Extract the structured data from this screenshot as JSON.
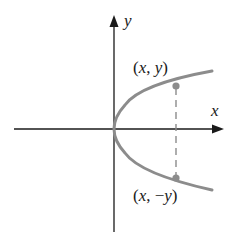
{
  "diagram": {
    "axes": {
      "x_label": "x",
      "y_label": "y"
    },
    "curve": {
      "equation_hint": "x = y^2",
      "color": "#8c8c8c"
    },
    "points": [
      {
        "label": "(x, y)",
        "x_part": "x",
        "y_part": "y",
        "sign": ""
      },
      {
        "label": "(x, −y)",
        "x_part": "x",
        "y_part": "y",
        "sign": "−"
      }
    ],
    "colors": {
      "axis": "#1a1a1a",
      "curve": "#8c8c8c",
      "point": "#8c8c8c",
      "dashed_line": "#8c8c8c",
      "text": "#1a1a1a"
    }
  }
}
